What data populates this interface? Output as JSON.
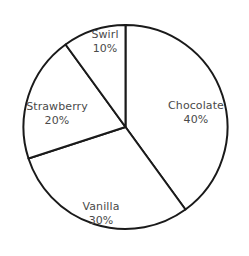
{
  "chart_data": {
    "type": "pie",
    "title": "",
    "subtitle": "",
    "xlabel": "",
    "ylabel": "",
    "legend_position": "none",
    "grid": false,
    "labels_inside": true,
    "start_angle_deg": 0,
    "direction": "clockwise",
    "categories": [
      "Chocolate",
      "Vanilla",
      "Strawberry",
      "Swirl"
    ],
    "values": [
      40,
      30,
      20,
      10
    ],
    "value_unit": "%",
    "slices": [
      {
        "name": "Chocolate",
        "value": 40,
        "value_text": "40%",
        "start_angle_deg": 0,
        "end_angle_deg": 144,
        "fill": "#ffffff",
        "stroke": "#1a1a1a",
        "label_x": 196,
        "label_y": 112
      },
      {
        "name": "Vanilla",
        "value": 30,
        "value_text": "30%",
        "start_angle_deg": 144,
        "end_angle_deg": 252,
        "fill": "#ffffff",
        "stroke": "#1a1a1a",
        "label_x": 101,
        "label_y": 213
      },
      {
        "name": "Strawberry",
        "value": 20,
        "value_text": "20%",
        "start_angle_deg": 252,
        "end_angle_deg": 324,
        "fill": "#ffffff",
        "stroke": "#1a1a1a",
        "label_x": 57,
        "label_y": 113
      },
      {
        "name": "Swirl",
        "value": 10,
        "value_text": "10%",
        "start_angle_deg": 324,
        "end_angle_deg": 360,
        "fill": "#ffffff",
        "stroke": "#1a1a1a",
        "label_x": 105,
        "label_y": 41
      }
    ],
    "geometry": {
      "center_x": 125.5,
      "center_y": 127,
      "radius": 102,
      "stroke_width": 2
    },
    "colors": {
      "background": "#ffffff",
      "outline": "#1a1a1a",
      "label_text": "#4a4a4a"
    }
  }
}
